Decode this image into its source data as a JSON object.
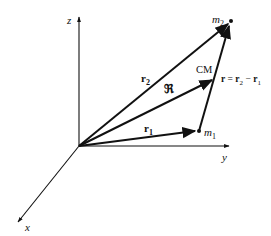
{
  "axes": {
    "z_label": "z",
    "y_label": "y",
    "x_label": "x"
  },
  "vectors": {
    "r1": {
      "label": "r",
      "sub": "1"
    },
    "r2": {
      "label": "r",
      "sub": "2"
    },
    "R": {
      "label": "ℜ"
    },
    "r_rel": {
      "lhs": "r",
      "eq": " = ",
      "a": "r",
      "a_sub": "2",
      "minus": " − ",
      "b": "r",
      "b_sub": "1"
    }
  },
  "points": {
    "m1": {
      "label": "m",
      "sub": "1"
    },
    "m2": {
      "label": "m",
      "sub": "2"
    },
    "cm": {
      "label": "CM"
    }
  },
  "colors": {
    "ink": "#111111",
    "background": "#ffffff"
  }
}
